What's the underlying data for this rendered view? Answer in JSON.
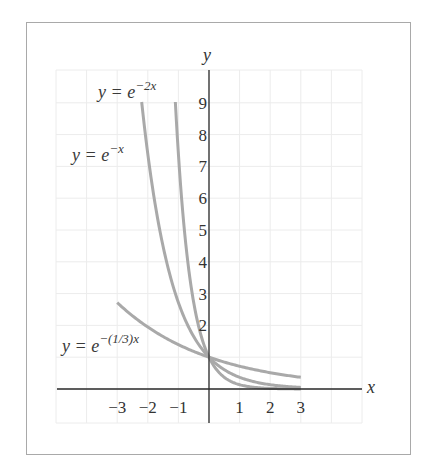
{
  "chart_data": {
    "type": "line",
    "title": "",
    "xlabel": "x",
    "ylabel": "y",
    "xlim": [
      -5,
      5
    ],
    "ylim": [
      -1,
      10
    ],
    "grid": true,
    "x_tick_labels": [
      "-3",
      "-2",
      "-1",
      "1",
      "2",
      "3"
    ],
    "y_tick_labels": [
      "2",
      "3",
      "4",
      "5",
      "6",
      "7",
      "8",
      "9"
    ],
    "series": [
      {
        "name": "y = e^{-2x}",
        "label_main": "y = e",
        "label_exp": "−2x",
        "domain": [
          -1.1,
          3
        ],
        "x": [
          -1.1,
          -1.0,
          -0.75,
          -0.5,
          -0.25,
          0,
          0.5,
          1,
          1.5,
          2,
          2.5,
          3
        ],
        "y": [
          9.03,
          7.39,
          4.48,
          2.72,
          1.65,
          1.0,
          0.37,
          0.14,
          0.05,
          0.02,
          0.01,
          0.0
        ]
      },
      {
        "name": "y = e^{-x}",
        "label_main": "y = e",
        "label_exp": "−x",
        "domain": [
          -2.2,
          3
        ],
        "x": [
          -2.2,
          -2,
          -1.5,
          -1,
          -0.5,
          0,
          0.5,
          1,
          1.5,
          2,
          2.5,
          3
        ],
        "y": [
          9.03,
          7.39,
          4.48,
          2.72,
          1.65,
          1.0,
          0.61,
          0.37,
          0.22,
          0.14,
          0.08,
          0.05
        ]
      },
      {
        "name": "y = e^{-(1/3)x}",
        "label_main": "y = e",
        "label_exp": "−(1/3)x",
        "domain": [
          -3,
          3
        ],
        "x": [
          -3,
          -2,
          -1,
          0,
          1,
          2,
          3
        ],
        "y": [
          2.72,
          1.95,
          1.4,
          1.0,
          0.72,
          0.51,
          0.37
        ]
      }
    ]
  },
  "axes": {
    "x_label": "x",
    "y_label": "y",
    "x_ticks": [
      {
        "value": -3,
        "text": "−3"
      },
      {
        "value": -2,
        "text": "−2"
      },
      {
        "value": -1,
        "text": "−1"
      },
      {
        "value": 1,
        "text": "1"
      },
      {
        "value": 2,
        "text": "2"
      },
      {
        "value": 3,
        "text": "3"
      }
    ],
    "y_ticks": [
      {
        "value": 2,
        "text": "2"
      },
      {
        "value": 3,
        "text": "3"
      },
      {
        "value": 4,
        "text": "4"
      },
      {
        "value": 5,
        "text": "5"
      },
      {
        "value": 6,
        "text": "6"
      },
      {
        "value": 7,
        "text": "7"
      },
      {
        "value": 8,
        "text": "8"
      },
      {
        "value": 9,
        "text": "9"
      }
    ]
  },
  "colors": {
    "curve": "#a9a9a9",
    "axis": "#2a2a2a",
    "grid": "#ececec",
    "frame": "#a9a9a9"
  }
}
